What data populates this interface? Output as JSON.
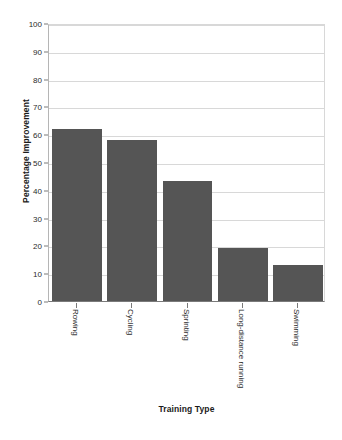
{
  "chart_data": {
    "type": "bar",
    "title": "",
    "xlabel": "Training Type",
    "ylabel": "Percentage Improvement",
    "categories": [
      "Rowing",
      "Cycling",
      "Sprinting",
      "Long-distance running",
      "Swimming"
    ],
    "values": [
      62,
      58,
      43,
      19,
      13
    ],
    "ylim": [
      0,
      100
    ],
    "yticks": [
      0,
      10,
      20,
      30,
      40,
      50,
      60,
      70,
      80,
      90,
      100
    ],
    "ytick_labels": [
      "0",
      "10",
      "20",
      "30",
      "40",
      "50",
      "60",
      "70",
      "80",
      "90",
      "100"
    ],
    "grid": true,
    "legend": false,
    "bar_color": "#555555",
    "grid_color": "#d8d8d8",
    "axis_color": "#7a7a7a",
    "background": "#ffffff"
  }
}
